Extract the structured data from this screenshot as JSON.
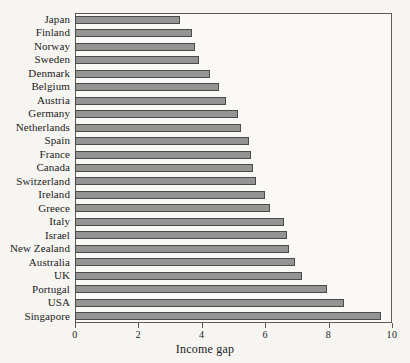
{
  "chart_data": {
    "type": "bar",
    "orientation": "horizontal",
    "title": "",
    "xlabel": "Income gap",
    "ylabel": "",
    "xlim": [
      0,
      10
    ],
    "ylim": null,
    "grid": false,
    "legend": null,
    "xticks": [
      "0",
      "2",
      "4",
      "6",
      "8",
      "10"
    ],
    "xtick_values": [
      0,
      2,
      4,
      6,
      8,
      10
    ],
    "categories": [
      "Japan",
      "Finland",
      "Norway",
      "Sweden",
      "Denmark",
      "Belgium",
      "Austria",
      "Germany",
      "Netherlands",
      "Spain",
      "France",
      "Canada",
      "Switzerland",
      "Ireland",
      "Greece",
      "Italy",
      "Israel",
      "New Zealand",
      "Australia",
      "UK",
      "Portugal",
      "USA",
      "Singapore"
    ],
    "values": [
      3.3,
      3.7,
      3.8,
      3.9,
      4.25,
      4.55,
      4.75,
      5.15,
      5.25,
      5.5,
      5.55,
      5.6,
      5.7,
      6.0,
      6.15,
      6.6,
      6.7,
      6.75,
      6.95,
      7.15,
      7.95,
      8.5,
      9.65
    ],
    "colors": {
      "bar_fill": "#949494",
      "bar_edge": "#4a4a4a",
      "axis": "#5c5a57",
      "text": "#1b1b1b",
      "page_background": "#f6f5f2",
      "plot_background": "#faf9f6"
    }
  }
}
